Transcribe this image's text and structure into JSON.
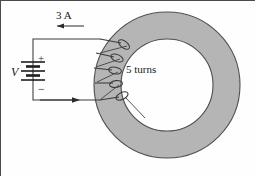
{
  "figure": {
    "kind": "toroid-coil-circuit-diagram",
    "labels": {
      "current": "3 A",
      "voltage": "V",
      "turns": "5 turns",
      "polarity_positive": "+",
      "polarity_negative": "−"
    },
    "colors": {
      "torus_fill": "#b5b5b5",
      "torus_stroke": "#4f4f4f",
      "wire": "#3a3a3a",
      "text": "#1a1a1a",
      "frame": "#4a4a4a",
      "background": "#fefefe"
    },
    "geometry": {
      "torus": {
        "cx": 167,
        "cy": 85,
        "outer_r": 73,
        "inner_r": 46
      },
      "circuit": {
        "left_x": 33,
        "top_y": 39,
        "bottom_y": 100,
        "battery_y": 72
      },
      "coil": {
        "turns": 5,
        "top_y": 43,
        "bottom_y": 97
      }
    },
    "annotations": {
      "current_arrow_direction": "left",
      "return_arrow_direction": "right"
    }
  }
}
